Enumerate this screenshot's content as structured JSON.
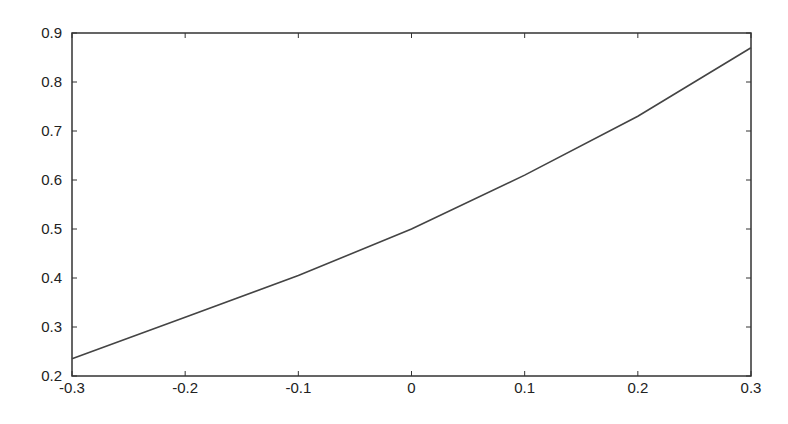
{
  "chart_data": {
    "type": "line",
    "title": "",
    "xlabel": "",
    "ylabel": "",
    "xlim": [
      -0.3,
      0.3
    ],
    "ylim": [
      0.2,
      0.9
    ],
    "x_ticks": [
      "-0.3",
      "-0.2",
      "-0.1",
      "0",
      "0.1",
      "0.2",
      "0.3"
    ],
    "y_ticks": [
      "0.2",
      "0.3",
      "0.4",
      "0.5",
      "0.6",
      "0.7",
      "0.8",
      "0.9"
    ],
    "grid": false,
    "series": [
      {
        "name": "",
        "color": "#444444",
        "x": [
          -0.3,
          -0.2,
          -0.1,
          0,
          0.1,
          0.2,
          0.3
        ],
        "y": [
          0.235,
          0.32,
          0.405,
          0.5,
          0.61,
          0.73,
          0.87
        ]
      }
    ]
  }
}
